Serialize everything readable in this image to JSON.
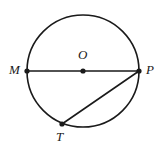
{
  "figure": {
    "type": "circle-geometry-diagram",
    "background_color": "#ffffff",
    "stroke_color": "#1a1a1a",
    "stroke_width": 1.6,
    "circle": {
      "center_label": "O",
      "center_x": 83,
      "center_y": 71,
      "radius": 56
    },
    "points": [
      {
        "id": "M",
        "label": "M",
        "x": 27,
        "y": 71,
        "dot": true,
        "label_position": "left"
      },
      {
        "id": "O",
        "label": "O",
        "x": 83,
        "y": 71,
        "dot": true,
        "label_position": "above"
      },
      {
        "id": "P",
        "label": "P",
        "x": 139,
        "y": 71,
        "dot": true,
        "label_position": "right"
      },
      {
        "id": "T",
        "label": "T",
        "x": 62,
        "y": 124,
        "dot": true,
        "label_position": "below"
      }
    ],
    "segments": [
      {
        "id": "MP",
        "from": "M",
        "to": "P",
        "kind": "diameter"
      },
      {
        "id": "TP",
        "from": "T",
        "to": "P",
        "kind": "chord"
      }
    ],
    "dot_radius": 2.6
  }
}
